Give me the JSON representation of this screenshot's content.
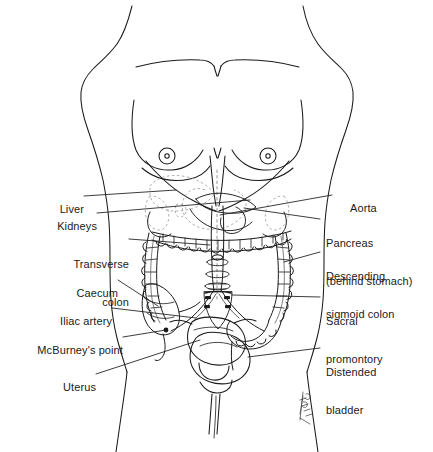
{
  "figure": {
    "background_color": "#ffffff",
    "line_color": "#1a1a1a",
    "faint_line_color": "#8a8a8a",
    "signature": "artist-signature"
  },
  "labels": {
    "left": [
      {
        "id": "liver",
        "text": "Liver"
      },
      {
        "id": "kidneys",
        "text": "Kidneys"
      },
      {
        "id": "transverse-colon-line1",
        "text": "Transverse"
      },
      {
        "id": "transverse-colon-line2",
        "text": "colon"
      },
      {
        "id": "caecum",
        "text": "Caecum"
      },
      {
        "id": "iliac-artery",
        "text": "Iliac artery"
      },
      {
        "id": "mcburneys-point",
        "text": "McBurney's point"
      },
      {
        "id": "uterus",
        "text": "Uterus"
      }
    ],
    "right": [
      {
        "id": "aorta",
        "text": "Aorta"
      },
      {
        "id": "pancreas-line1",
        "text": "Pancreas"
      },
      {
        "id": "pancreas-line2",
        "text": "(behind stomach)"
      },
      {
        "id": "descending-sigmoid-line1",
        "text": "Descending"
      },
      {
        "id": "descending-sigmoid-line2",
        "text": "sigmoid colon"
      },
      {
        "id": "sacral-promontory-line1",
        "text": "Sacral"
      },
      {
        "id": "sacral-promontory-line2",
        "text": "promontory"
      },
      {
        "id": "distended-bladder-line1",
        "text": "Distended"
      },
      {
        "id": "distended-bladder-line2",
        "text": "bladder"
      }
    ]
  }
}
